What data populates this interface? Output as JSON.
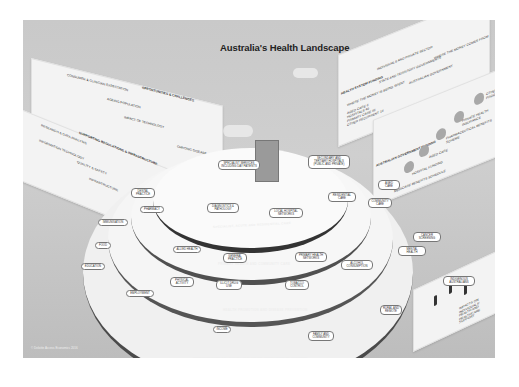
{
  "title": "Australia's Health Landscape",
  "copyright": "© Deloitte Access Economics 2016",
  "panels": {
    "opportunities": {
      "heading": "Opportunities & Challenges",
      "items": [
        "Consumer & clinician expectation",
        "Ageing population",
        "Impact of technology",
        "Chronic disease"
      ]
    },
    "infrastructure": {
      "heading": "Supporting Regulations & Infrastructure",
      "items": [
        "Research & data analysis",
        "Information technology",
        "Quality & safety",
        "Infrastructure",
        "Workforce"
      ]
    },
    "funding": {
      "heading": "Health System Funding",
      "subheading": "Where the money comes from",
      "where_spent": "Where the money is being spent",
      "spent_items": [
        "Aged Care 6",
        "Hospitals 40",
        "Primary Care 36",
        "Other recurrent 18"
      ],
      "sources": [
        "Individuals and private sector",
        "State and territory governments",
        "Australian Government"
      ]
    },
    "gov_funding": {
      "heading": "Australian Government Funding",
      "items": [
        "Other Programs",
        "Private Health Insurance",
        "Pharmaceutical Benefits Scheme",
        "Aged Care",
        "Hospital Funding",
        "Medicare Benefits Schedule"
      ]
    },
    "impacts": {
      "label": "Impacts on individuals' health and healthcare support"
    }
  },
  "rings": [
    {
      "band": "Specialist, Acute and Residential Care",
      "items": [
        "Specialist services including day patients",
        "Secondary and tertiary hospitals (public and private)",
        "Diagnostics & pathology",
        "Local hospital networks",
        "Residential care",
        "Aged care"
      ]
    },
    {
      "band": "Primary Health and Community Care",
      "items": [
        "Dental practice",
        "Pharmacy",
        "Allied health",
        "General practice",
        "Primary health networks",
        "Community care",
        "Cancer screening"
      ]
    },
    {
      "band": "Health Promotion and Disease Prevention",
      "items": [
        "Immunisation",
        "Food",
        "Physical activity",
        "Illicit drug use",
        "Tobacco control",
        "Alcohol consumption",
        "Mental health"
      ]
    },
    {
      "band": "Determinants of Health and Other Demographic Factors",
      "items": [
        "Education",
        "Employment",
        "Income",
        "Family and community",
        "Rural and remote",
        "Indigenous Australians"
      ]
    }
  ]
}
